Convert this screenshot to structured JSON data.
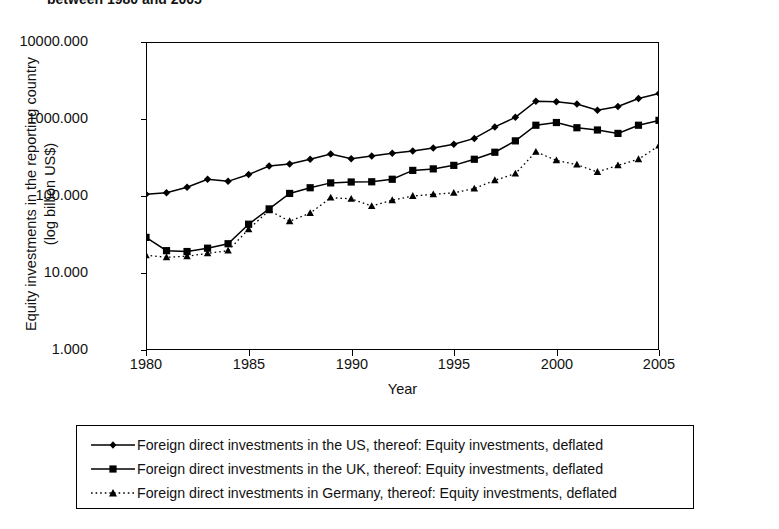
{
  "caption": {
    "text": "between 1980 and 2005"
  },
  "axes": {
    "ylabel_line1": "Equity investments in the reporting country",
    "ylabel_line2": "(log billion US$)",
    "xlabel": "Year",
    "yticks": [
      "10000.000",
      "1000.000",
      "100.000",
      "10.000",
      "1.000"
    ],
    "xticks": [
      "1980",
      "1985",
      "1990",
      "1995",
      "2000",
      "2005"
    ]
  },
  "legend": {
    "items": [
      {
        "label": "Foreign direct investments in the US, thereof: Equity investments, deflated",
        "marker": "diamond-marker",
        "line": "solid"
      },
      {
        "label": "Foreign direct investments in the UK, thereof: Equity investments, deflated",
        "marker": "square-marker",
        "line": "solid"
      },
      {
        "label": "Foreign direct investments in Germany, thereof: Equity investments, deflated",
        "marker": "triangle-marker",
        "line": "dotted"
      }
    ]
  },
  "chart_data": {
    "type": "line",
    "title": "between 1980 and 2005",
    "xlabel": "Year",
    "ylabel": "Equity investments in the reporting country (log billion US$)",
    "yscale": "log",
    "ylim": [
      1,
      10000
    ],
    "xlim": [
      1980,
      2005
    ],
    "grid": false,
    "legend_position": "bottom",
    "x": [
      1980,
      1981,
      1982,
      1983,
      1984,
      1985,
      1986,
      1987,
      1988,
      1989,
      1990,
      1991,
      1992,
      1993,
      1994,
      1995,
      1996,
      1997,
      1998,
      1999,
      2000,
      2001,
      2002,
      2003,
      2004,
      2005
    ],
    "series": [
      {
        "name": "Foreign direct investments in the US, thereof: Equity investments, deflated",
        "marker": "diamond",
        "linestyle": "solid",
        "color": "#000000",
        "values": [
          105,
          110,
          130,
          165,
          155,
          190,
          245,
          260,
          300,
          350,
          305,
          330,
          360,
          385,
          420,
          470,
          560,
          790,
          1050,
          1700,
          1680,
          1570,
          1300,
          1450,
          1850,
          2150
        ]
      },
      {
        "name": "Foreign direct investments in the UK, thereof: Equity investments, deflated",
        "marker": "square",
        "linestyle": "solid",
        "color": "#000000",
        "values": [
          29,
          19.5,
          19,
          21,
          24,
          43,
          68,
          108,
          128,
          148,
          152,
          153,
          165,
          215,
          225,
          250,
          300,
          370,
          520,
          830,
          900,
          770,
          720,
          650,
          830,
          960
        ]
      },
      {
        "name": "Foreign direct investments in Germany, thereof: Equity investments, deflated",
        "marker": "triangle",
        "linestyle": "dotted",
        "color": "#000000",
        "values": [
          17,
          16,
          16.5,
          18,
          19.5,
          37,
          65,
          47,
          60,
          95,
          92,
          74,
          88,
          100,
          105,
          110,
          125,
          160,
          195,
          375,
          290,
          255,
          205,
          250,
          300,
          450
        ]
      }
    ]
  }
}
